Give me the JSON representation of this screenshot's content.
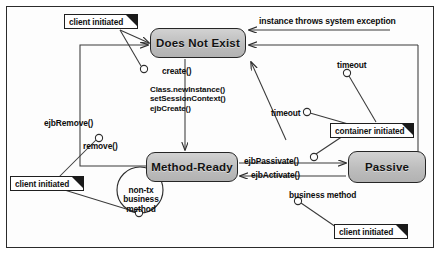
{
  "diagram": {
    "type": "uml-state-diagram",
    "colors": {
      "state_fill": "#bdbdbd",
      "state_border": "#262626",
      "note_fill": "#ffffff",
      "line": "#3a3a3a",
      "frame": "#2b2b2b"
    },
    "states": [
      {
        "id": "does-not-exist",
        "label": "Does Not  Exist"
      },
      {
        "id": "method-ready",
        "label": "Method-Ready"
      },
      {
        "id": "passive",
        "label": "Passive"
      }
    ],
    "notes": [
      {
        "id": "client-initiated-top",
        "label": "client initiated"
      },
      {
        "id": "client-initiated-left",
        "label": "client initiated"
      },
      {
        "id": "client-initiated-right",
        "label": "client initiated"
      },
      {
        "id": "container-initiated",
        "label": "container initiated"
      }
    ],
    "transitions": [
      {
        "id": "create",
        "label": "create()",
        "from": "does-not-exist",
        "to": "method-ready"
      },
      {
        "id": "create-actions",
        "label": "Class.newInstance()\nsetSessionContext()\nejbCreate()",
        "lines": [
          "Class.newInstance()",
          "setSessionContext()",
          "ejbCreate()"
        ]
      },
      {
        "id": "remove",
        "label": "remove()",
        "from": "method-ready",
        "to": "does-not-exist"
      },
      {
        "id": "ejb-remove",
        "label": "ejbRemove()",
        "from": "method-ready",
        "to": "does-not-exist"
      },
      {
        "id": "system-exception",
        "label": "instance throws system exception",
        "from": "method-ready",
        "to": "does-not-exist"
      },
      {
        "id": "timeout-passive",
        "label": "timeout",
        "from": "passive",
        "to": "does-not-exist"
      },
      {
        "id": "timeout-method",
        "label": "timeout",
        "from": "method-ready",
        "to": "does-not-exist"
      },
      {
        "id": "ejb-passivate",
        "label": "ejbPassivate()",
        "from": "method-ready",
        "to": "passive"
      },
      {
        "id": "ejb-activate",
        "label": "ejbActivate()",
        "from": "passive",
        "to": "method-ready"
      },
      {
        "id": "business-method",
        "label": "business method",
        "from": "passive",
        "to": "method-ready"
      },
      {
        "id": "non-tx-business",
        "label": "non-tx\nbusiness\nmethod",
        "lines": [
          "non-tx",
          "business",
          "method"
        ],
        "from": "method-ready",
        "to": "method-ready"
      }
    ]
  }
}
